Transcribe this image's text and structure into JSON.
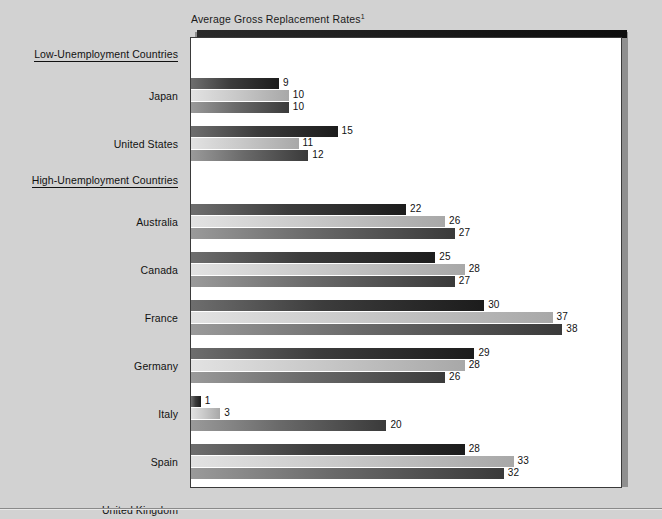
{
  "chart_data": {
    "type": "bar",
    "orientation": "horizontal",
    "title": "Average Gross Replacement Rates",
    "title_footnote": "1",
    "xlabel": "",
    "ylabel": "",
    "xlim": [
      0,
      44
    ],
    "grid": false,
    "legend_position": "top-right",
    "series": [
      {
        "name": "1980",
        "color": "#2d2d2d",
        "values": [
          9,
          15,
          22,
          25,
          30,
          29,
          1,
          28,
          24
        ]
      },
      {
        "name": "1990",
        "color": "#c4c4c4",
        "values": [
          10,
          11,
          26,
          28,
          37,
          28,
          3,
          33,
          18
        ]
      },
      {
        "name": "1995",
        "color": "#4a4a4a",
        "values": [
          10,
          12,
          27,
          27,
          38,
          26,
          20,
          32,
          18
        ]
      }
    ],
    "categories": [
      "Japan",
      "United States",
      "Australia",
      "Canada",
      "France",
      "Germany",
      "Italy",
      "Spain",
      "United Kingdom"
    ],
    "groups": [
      {
        "label": "Low-Unemployment Countries",
        "categories": [
          "Japan",
          "United States"
        ]
      },
      {
        "label": "High-Unemployment Countries",
        "categories": [
          "Australia",
          "Canada",
          "France",
          "Germany",
          "Italy",
          "Spain",
          "United Kingdom"
        ]
      }
    ]
  },
  "legend": {
    "items": [
      {
        "label": "1980",
        "swatch_class": "sw1980"
      },
      {
        "label": "1990",
        "swatch_class": "sw1990"
      },
      {
        "label": "1995",
        "swatch_class": "sw1995"
      }
    ]
  },
  "colors": {
    "page_background": "#d2d2d2",
    "plot_background": "#ffffff",
    "frame_border": "#3a3a3a",
    "text": "#111111"
  }
}
